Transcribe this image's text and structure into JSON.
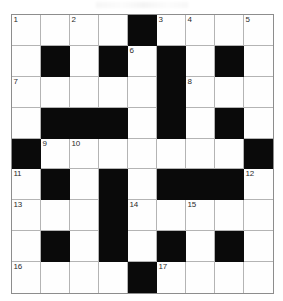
{
  "puzzle": {
    "type": "crossword-grid",
    "title": "",
    "rows": 9,
    "columns": 9,
    "colors": {
      "block": "#0a0a0a",
      "open": "#fefefe",
      "grid_line": "#b4b4b4",
      "border": "#8d8d8d",
      "number_text": "#2b2b2b"
    },
    "cells": [
      [
        {
          "block": false,
          "number": "1"
        },
        {
          "block": false,
          "number": ""
        },
        {
          "block": false,
          "number": "2"
        },
        {
          "block": false,
          "number": ""
        },
        {
          "block": true,
          "number": ""
        },
        {
          "block": false,
          "number": "3"
        },
        {
          "block": false,
          "number": "4"
        },
        {
          "block": false,
          "number": ""
        },
        {
          "block": false,
          "number": "5"
        }
      ],
      [
        {
          "block": false,
          "number": ""
        },
        {
          "block": true,
          "number": ""
        },
        {
          "block": false,
          "number": ""
        },
        {
          "block": true,
          "number": ""
        },
        {
          "block": false,
          "number": "6"
        },
        {
          "block": true,
          "number": ""
        },
        {
          "block": false,
          "number": ""
        },
        {
          "block": true,
          "number": ""
        },
        {
          "block": false,
          "number": ""
        }
      ],
      [
        {
          "block": false,
          "number": "7"
        },
        {
          "block": false,
          "number": ""
        },
        {
          "block": false,
          "number": ""
        },
        {
          "block": false,
          "number": ""
        },
        {
          "block": false,
          "number": ""
        },
        {
          "block": true,
          "number": ""
        },
        {
          "block": false,
          "number": "8"
        },
        {
          "block": false,
          "number": ""
        },
        {
          "block": false,
          "number": ""
        }
      ],
      [
        {
          "block": false,
          "number": ""
        },
        {
          "block": true,
          "number": ""
        },
        {
          "block": true,
          "number": ""
        },
        {
          "block": true,
          "number": ""
        },
        {
          "block": false,
          "number": ""
        },
        {
          "block": true,
          "number": ""
        },
        {
          "block": false,
          "number": ""
        },
        {
          "block": true,
          "number": ""
        },
        {
          "block": false,
          "number": ""
        }
      ],
      [
        {
          "block": true,
          "number": ""
        },
        {
          "block": false,
          "number": "9"
        },
        {
          "block": false,
          "number": "10"
        },
        {
          "block": false,
          "number": ""
        },
        {
          "block": false,
          "number": ""
        },
        {
          "block": false,
          "number": ""
        },
        {
          "block": false,
          "number": ""
        },
        {
          "block": false,
          "number": ""
        },
        {
          "block": true,
          "number": ""
        }
      ],
      [
        {
          "block": false,
          "number": "11"
        },
        {
          "block": true,
          "number": ""
        },
        {
          "block": false,
          "number": ""
        },
        {
          "block": true,
          "number": ""
        },
        {
          "block": false,
          "number": ""
        },
        {
          "block": true,
          "number": ""
        },
        {
          "block": true,
          "number": ""
        },
        {
          "block": true,
          "number": ""
        },
        {
          "block": false,
          "number": "12"
        }
      ],
      [
        {
          "block": false,
          "number": "13"
        },
        {
          "block": false,
          "number": ""
        },
        {
          "block": false,
          "number": ""
        },
        {
          "block": true,
          "number": ""
        },
        {
          "block": false,
          "number": "14"
        },
        {
          "block": false,
          "number": ""
        },
        {
          "block": false,
          "number": "15"
        },
        {
          "block": false,
          "number": ""
        },
        {
          "block": false,
          "number": ""
        }
      ],
      [
        {
          "block": false,
          "number": ""
        },
        {
          "block": true,
          "number": ""
        },
        {
          "block": false,
          "number": ""
        },
        {
          "block": true,
          "number": ""
        },
        {
          "block": false,
          "number": ""
        },
        {
          "block": true,
          "number": ""
        },
        {
          "block": false,
          "number": ""
        },
        {
          "block": true,
          "number": ""
        },
        {
          "block": false,
          "number": ""
        }
      ],
      [
        {
          "block": false,
          "number": "16"
        },
        {
          "block": false,
          "number": ""
        },
        {
          "block": false,
          "number": ""
        },
        {
          "block": false,
          "number": ""
        },
        {
          "block": true,
          "number": ""
        },
        {
          "block": false,
          "number": "17"
        },
        {
          "block": false,
          "number": ""
        },
        {
          "block": false,
          "number": ""
        },
        {
          "block": false,
          "number": ""
        }
      ]
    ]
  }
}
